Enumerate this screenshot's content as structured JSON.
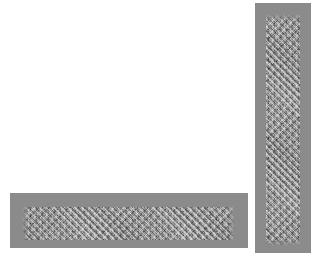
{
  "canvas": {
    "width": 321,
    "height": 266,
    "background_color": "#ffffff"
  },
  "colors": {
    "background": "#ffffff",
    "plate_fill": "#8b8b8b",
    "noise_light": "#d8d8d8",
    "noise_dark": "#2a2a2a"
  },
  "elements": {
    "horizontal_plate": {
      "name": "horizontal gray label plate",
      "x": 10,
      "y": 193,
      "width": 238,
      "height": 55,
      "fill": "#8b8b8b",
      "text_band": {
        "x": 22,
        "y": 207,
        "width": 213,
        "height": 33,
        "orientation": "horizontal",
        "content": "",
        "readable": false,
        "appearance": "illegible pixelated speckled noise standing in for text"
      }
    },
    "vertical_plate": {
      "name": "vertical gray label plate",
      "x": 255,
      "y": 3,
      "width": 56,
      "height": 250,
      "fill": "#8b8b8b",
      "text_band": {
        "x": 266,
        "y": 14,
        "width": 34,
        "height": 232,
        "orientation": "vertical",
        "content": "",
        "readable": false,
        "appearance": "illegible pixelated speckled noise standing in for rotated text"
      }
    }
  }
}
